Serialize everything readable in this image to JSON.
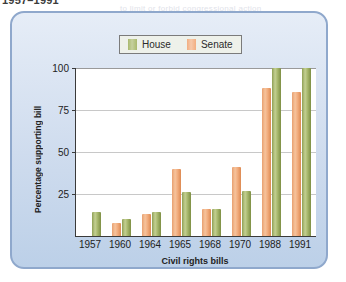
{
  "page": {
    "caption_top": "1957–1991",
    "bleed_lines": [
      {
        "text": "to limit or forbid congressional action",
        "x": 120,
        "y": 4
      },
      {
        "text": "those amendments to the bill which",
        "x": 40,
        "y": 60
      },
      {
        "text": "were not to be considered at all",
        "x": 55,
        "y": 80
      },
      {
        "text": "the committee system of the House",
        "x": 35,
        "y": 100
      },
      {
        "text": "cloture a key point of debate and",
        "x": 50,
        "y": 120
      },
      {
        "text": "observed a civil rights act",
        "x": 45,
        "y": 140
      },
      {
        "text": "support before it was passed",
        "x": 60,
        "y": 160
      }
    ]
  },
  "legend": {
    "entries": [
      {
        "label": "House",
        "color": "#a9b96e",
        "name": "house"
      },
      {
        "label": "Senate",
        "color": "#f2ae80",
        "name": "senate"
      }
    ]
  },
  "chart_data": {
    "type": "bar",
    "title": "1957–1991",
    "xlabel": "Civil rights bills",
    "ylabel": "Percentage supporting bill",
    "categories": [
      "1957",
      "1960",
      "1964",
      "1965",
      "1968",
      "1970",
      "1988",
      "1991"
    ],
    "series": [
      {
        "name": "Senate",
        "color": "#f2ae80",
        "values": [
          0,
          8,
          13,
          40,
          16,
          41,
          88,
          86
        ]
      },
      {
        "name": "House",
        "color": "#a9b96e",
        "values": [
          14,
          10,
          14,
          26,
          16,
          27,
          100,
          100
        ]
      }
    ],
    "ylim": [
      0,
      100
    ],
    "yticks": [
      25,
      50,
      75,
      100
    ],
    "grid": true,
    "legend_position": "top-center"
  }
}
